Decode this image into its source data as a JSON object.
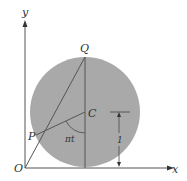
{
  "diagram": {
    "type": "geometry",
    "labels": {
      "y_axis": "y",
      "x_axis": "x",
      "origin": "O",
      "top_point": "Q",
      "center": "C",
      "point_on_circle": "P",
      "angle": "πt",
      "radius_dimension": "1"
    },
    "colors": {
      "circle_fill": "#a9a9a9",
      "lines": "#555555",
      "axes": "#555555",
      "background": "#ffffff"
    },
    "geometry": {
      "origin_px": [
        25,
        168
      ],
      "circle_center_px": [
        85,
        112
      ],
      "circle_radius_px": 55,
      "Q_px": [
        85,
        57
      ],
      "P_px": [
        36,
        135
      ],
      "C_px": [
        85,
        112
      ]
    }
  }
}
